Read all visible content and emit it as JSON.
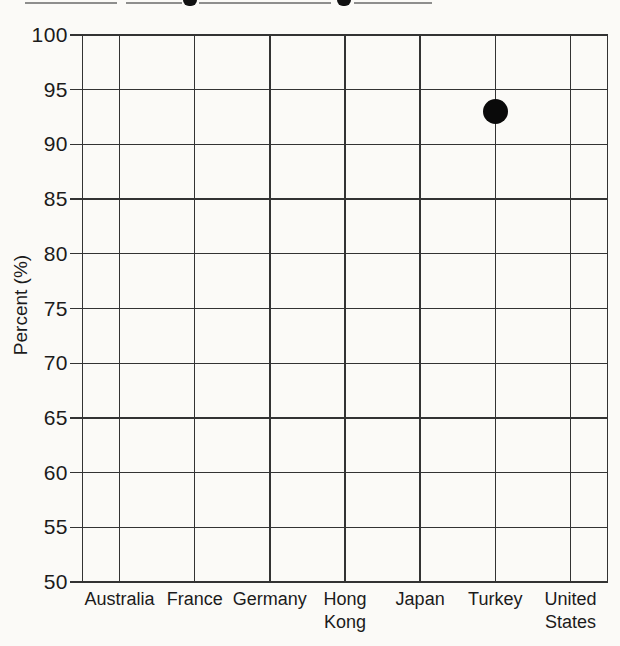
{
  "chart_data": {
    "type": "scatter",
    "title": "",
    "xlabel": "",
    "ylabel": "Percent (%)",
    "ylim": [
      50,
      100
    ],
    "ytick_step": 5,
    "yticks": [
      100,
      95,
      90,
      85,
      80,
      75,
      70,
      65,
      60,
      55,
      50
    ],
    "categories": [
      "Australia",
      "France",
      "Germany",
      "Hong Kong",
      "Japan",
      "Turkey",
      "United States"
    ],
    "grid": "on",
    "legend": "none",
    "series": [
      {
        "name": "percent-marker",
        "marker": "filled-circle",
        "marker_diameter_px": 25,
        "points": [
          {
            "category": "Turkey",
            "value": 93
          }
        ]
      }
    ]
  },
  "artifacts": {
    "top_edge_note": "bottom sliver of a cropped, illegible heading line"
  },
  "colors": {
    "background": "#fbfaf7",
    "grid_line": "#333333",
    "text": "#1b1b1b",
    "marker": "#0a0a0a"
  }
}
